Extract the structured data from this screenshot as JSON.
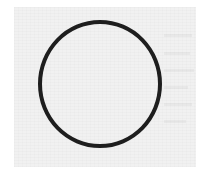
{
  "figure": {
    "shape": "circle",
    "stroke_color": "#1e1e1e",
    "fill": "none",
    "background_color": "#f1f1f1",
    "page_color": "#ffffff"
  }
}
